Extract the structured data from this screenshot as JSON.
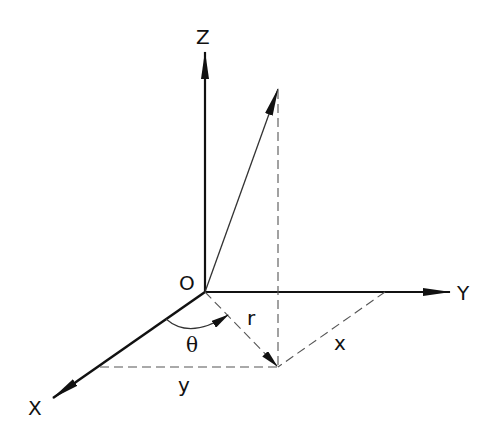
{
  "diagram": {
    "type": "3d-coordinate-system",
    "labels": {
      "z_axis": "Z",
      "y_axis": "Y",
      "x_axis": "X",
      "origin": "O",
      "radius": "r",
      "angle": "θ",
      "x_component": "x",
      "y_component": "y"
    },
    "colors": {
      "axis": "#111111",
      "vector": "#333333",
      "dashed": "#555555",
      "background": "#ffffff"
    },
    "points": {
      "origin": [
        205,
        292
      ],
      "z_tip": [
        205,
        50
      ],
      "y_tip": [
        452,
        292
      ],
      "x_tip": [
        52,
        398
      ],
      "vector_tip": [
        278,
        88
      ],
      "projection": [
        278,
        367
      ],
      "y_axis_foot": [
        385,
        292
      ],
      "x_axis_foot": [
        100,
        367
      ]
    }
  }
}
